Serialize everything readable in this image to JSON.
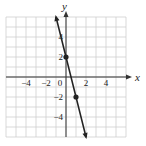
{
  "chart_data": {
    "type": "line",
    "title": "",
    "xlabel": "x",
    "ylabel": "y",
    "xlim": [
      -6,
      6
    ],
    "ylim": [
      -6,
      6
    ],
    "grid": true,
    "x_ticks": [
      -4,
      -2,
      0,
      2,
      4
    ],
    "y_ticks": [
      4,
      2,
      -2,
      -4
    ],
    "x_tick_labels": [
      "−4",
      "−2",
      "0",
      "2",
      "4"
    ],
    "y_tick_labels": [
      "4",
      "2",
      "−2",
      "−4"
    ],
    "series": [
      {
        "name": "line",
        "equation": "y = -4x + 2",
        "x": [
          -1,
          2
        ],
        "y": [
          6,
          -6
        ],
        "marked_points": [
          {
            "x": 0,
            "y": 2
          },
          {
            "x": 1,
            "y": -2
          }
        ]
      }
    ],
    "legend": null
  },
  "labels": {
    "x_axis": "x",
    "y_axis": "y"
  }
}
